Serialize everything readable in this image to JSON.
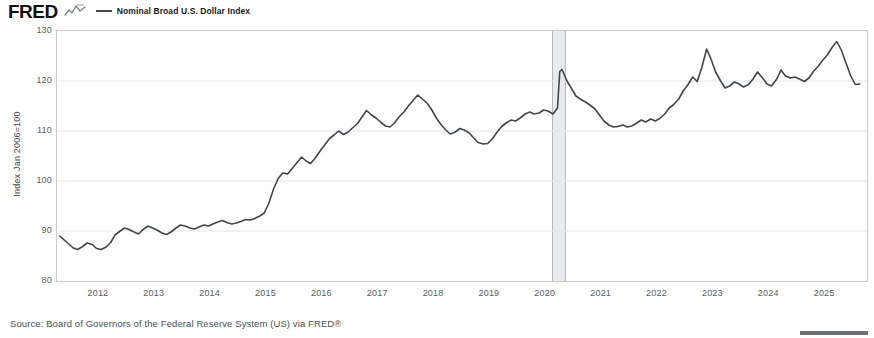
{
  "header": {
    "logo_text": "FRED",
    "logo_mark_icon": "fred-squiggle-icon",
    "legend": [
      {
        "label": "Nominal Broad U.S. Dollar Index",
        "color": "#42464c"
      }
    ]
  },
  "footer": {
    "source": "Source: Board of Governors of the Federal Reserve System (US) via FRED®",
    "brand_mark_icon": "fred-bar-mark-icon"
  },
  "chart_data": {
    "type": "line",
    "title": "",
    "subtitle": "",
    "xlabel": "",
    "ylabel": "Index Jan 2006=100",
    "ylim": [
      80,
      130
    ],
    "ytick_labels": [
      "130",
      "120",
      "110",
      "100",
      "90",
      "80"
    ],
    "yticks": [
      130,
      120,
      110,
      100,
      90,
      80
    ],
    "xlim": [
      2011.25,
      2025.75
    ],
    "xtick_labels": [
      "2012",
      "2013",
      "2014",
      "2015",
      "2016",
      "2017",
      "2018",
      "2019",
      "2020",
      "2021",
      "2022",
      "2023",
      "2024",
      "2025"
    ],
    "xticks": [
      2012,
      2013,
      2014,
      2015,
      2016,
      2017,
      2018,
      2019,
      2020,
      2021,
      2022,
      2023,
      2024,
      2025
    ],
    "grid": "horizontal",
    "legend_position": "top",
    "line_color": "#42464c",
    "line_width": 1.6,
    "recession_bands": [
      {
        "label": "2020 recession",
        "start": 2020.12,
        "end": 2020.35,
        "color": "#e9ebee"
      }
    ],
    "series": [
      {
        "name": "Nominal Broad U.S. Dollar Index",
        "color": "#42464c",
        "x": [
          2011.3,
          2011.38,
          2011.46,
          2011.54,
          2011.62,
          2011.71,
          2011.79,
          2011.88,
          2011.96,
          2012.04,
          2012.13,
          2012.21,
          2012.29,
          2012.38,
          2012.46,
          2012.54,
          2012.63,
          2012.71,
          2012.79,
          2012.88,
          2012.96,
          2013.04,
          2013.13,
          2013.21,
          2013.29,
          2013.38,
          2013.46,
          2013.54,
          2013.63,
          2013.71,
          2013.79,
          2013.88,
          2013.96,
          2014.04,
          2014.13,
          2014.21,
          2014.29,
          2014.38,
          2014.46,
          2014.54,
          2014.63,
          2014.71,
          2014.79,
          2014.88,
          2014.96,
          2015.04,
          2015.13,
          2015.21,
          2015.29,
          2015.38,
          2015.46,
          2015.54,
          2015.63,
          2015.71,
          2015.79,
          2015.88,
          2015.96,
          2016.04,
          2016.13,
          2016.21,
          2016.29,
          2016.38,
          2016.46,
          2016.54,
          2016.63,
          2016.71,
          2016.79,
          2016.88,
          2016.96,
          2017.04,
          2017.13,
          2017.21,
          2017.29,
          2017.38,
          2017.46,
          2017.54,
          2017.63,
          2017.71,
          2017.79,
          2017.88,
          2017.96,
          2018.04,
          2018.13,
          2018.21,
          2018.29,
          2018.38,
          2018.46,
          2018.54,
          2018.63,
          2018.71,
          2018.79,
          2018.88,
          2018.96,
          2019.04,
          2019.13,
          2019.21,
          2019.29,
          2019.38,
          2019.46,
          2019.54,
          2019.63,
          2019.71,
          2019.79,
          2019.88,
          2019.96,
          2020.04,
          2020.13,
          2020.21,
          2020.25,
          2020.29,
          2020.38,
          2020.46,
          2020.54,
          2020.63,
          2020.71,
          2020.79,
          2020.88,
          2020.96,
          2021.04,
          2021.13,
          2021.21,
          2021.29,
          2021.38,
          2021.46,
          2021.54,
          2021.63,
          2021.71,
          2021.79,
          2021.88,
          2021.96,
          2022.04,
          2022.13,
          2022.21,
          2022.29,
          2022.38,
          2022.46,
          2022.54,
          2022.63,
          2022.71,
          2022.79,
          2022.88,
          2022.96,
          2023.04,
          2023.13,
          2023.21,
          2023.29,
          2023.38,
          2023.46,
          2023.54,
          2023.63,
          2023.71,
          2023.79,
          2023.88,
          2023.96,
          2024.04,
          2024.13,
          2024.21,
          2024.29,
          2024.38,
          2024.46,
          2024.54,
          2024.63,
          2024.71,
          2024.79,
          2024.88,
          2024.96,
          2025.04,
          2025.13,
          2025.21,
          2025.29,
          2025.38,
          2025.46,
          2025.54,
          2025.62
        ],
        "values": [
          89.0,
          88.2,
          87.4,
          86.6,
          86.3,
          86.9,
          87.6,
          87.3,
          86.5,
          86.3,
          86.8,
          87.7,
          89.2,
          90.0,
          90.6,
          90.3,
          89.8,
          89.4,
          90.3,
          91.0,
          90.6,
          90.2,
          89.6,
          89.3,
          89.8,
          90.6,
          91.2,
          91.0,
          90.6,
          90.4,
          90.8,
          91.2,
          91.0,
          91.4,
          91.8,
          92.1,
          91.7,
          91.4,
          91.6,
          91.9,
          92.3,
          92.2,
          92.5,
          93.0,
          93.6,
          95.5,
          98.5,
          100.5,
          101.6,
          101.4,
          102.5,
          103.6,
          104.8,
          104.0,
          103.5,
          104.7,
          106.0,
          107.2,
          108.5,
          109.2,
          110.0,
          109.3,
          109.8,
          110.6,
          111.5,
          112.8,
          114.1,
          113.2,
          112.6,
          111.8,
          111.0,
          110.8,
          111.6,
          112.9,
          113.8,
          115.0,
          116.2,
          117.2,
          116.4,
          115.5,
          114.2,
          112.6,
          111.2,
          110.2,
          109.4,
          109.8,
          110.5,
          110.2,
          109.6,
          108.6,
          107.7,
          107.4,
          107.5,
          108.4,
          109.8,
          110.9,
          111.6,
          112.2,
          112.0,
          112.6,
          113.4,
          113.8,
          113.4,
          113.6,
          114.2,
          114.0,
          113.4,
          114.6,
          121.9,
          122.3,
          120.0,
          118.5,
          117.0,
          116.3,
          115.8,
          115.2,
          114.4,
          113.2,
          112.0,
          111.2,
          110.8,
          110.9,
          111.2,
          110.8,
          111.0,
          111.6,
          112.2,
          111.8,
          112.4,
          112.0,
          112.5,
          113.4,
          114.6,
          115.3,
          116.4,
          118.0,
          119.2,
          120.8,
          119.9,
          122.6,
          126.4,
          124.3,
          121.8,
          120.0,
          118.6,
          119.0,
          119.8,
          119.4,
          118.8,
          119.3,
          120.4,
          121.8,
          120.6,
          119.4,
          119.0,
          120.3,
          122.2,
          121.0,
          120.6,
          120.8,
          120.4,
          119.9,
          120.6,
          121.9,
          123.0,
          124.2,
          125.2,
          126.8,
          127.9,
          126.2,
          123.4,
          121.0,
          119.3,
          119.4
        ]
      }
    ]
  }
}
